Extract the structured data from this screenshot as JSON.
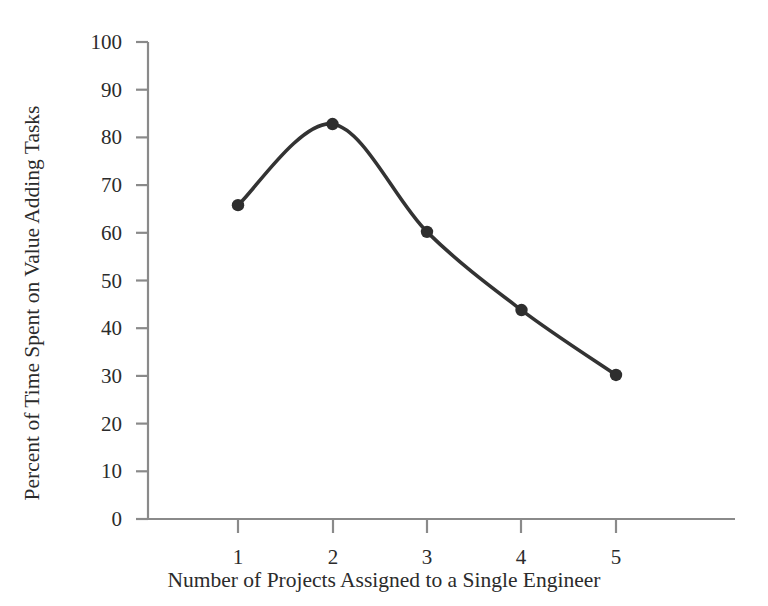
{
  "chart_data": {
    "type": "line",
    "title": "",
    "xlabel": "Number of Projects Assigned to a Single Engineer",
    "ylabel": "Percent of Time Spent on Value Adding Tasks",
    "x": [
      1,
      2,
      3,
      4,
      5
    ],
    "values": [
      65.8,
      82.8,
      60.2,
      43.8,
      30.2
    ],
    "categories": [
      "1",
      "2",
      "3",
      "4",
      "5"
    ],
    "xtick_labels": [
      "1",
      "2",
      "3",
      "4",
      "5"
    ],
    "ytick_labels": [
      "0",
      "10",
      "20",
      "30",
      "40",
      "50",
      "60",
      "70",
      "80",
      "90",
      "100"
    ],
    "ytick_values": [
      0,
      10,
      20,
      30,
      40,
      50,
      60,
      70,
      80,
      90,
      100
    ],
    "xlim": [
      0.35,
      5.9
    ],
    "ylim": [
      0,
      100
    ],
    "grid": false,
    "legend": null,
    "marker": "circle",
    "line_style": "smooth-spline",
    "series": [
      {
        "name": "Percent of Time Spent on Value Adding Tasks",
        "values": [
          65.8,
          82.8,
          60.2,
          43.8,
          30.2
        ]
      }
    ],
    "colors": {
      "line": "#333333",
      "marker": "#2e2e2e",
      "axis": "#8a8a8a",
      "text": "#2b2b2b",
      "background": "#ffffff"
    }
  }
}
